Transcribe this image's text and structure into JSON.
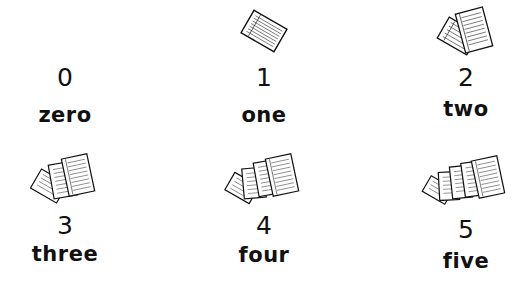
{
  "items": [
    {
      "count": 0,
      "numeral": "0",
      "word": "zero",
      "icon": "paper-stack-0-icon"
    },
    {
      "count": 1,
      "numeral": "1",
      "word": "one",
      "icon": "paper-stack-1-icon"
    },
    {
      "count": 2,
      "numeral": "2",
      "word": "two",
      "icon": "paper-stack-2-icon"
    },
    {
      "count": 3,
      "numeral": "3",
      "word": "three",
      "icon": "paper-stack-3-icon"
    },
    {
      "count": 4,
      "numeral": "4",
      "word": "four",
      "icon": "paper-stack-4-icon"
    },
    {
      "count": 5,
      "numeral": "5",
      "word": "five",
      "icon": "paper-stack-5-icon"
    }
  ],
  "colors": {
    "background": "#ffffff",
    "ink": "#111111"
  }
}
